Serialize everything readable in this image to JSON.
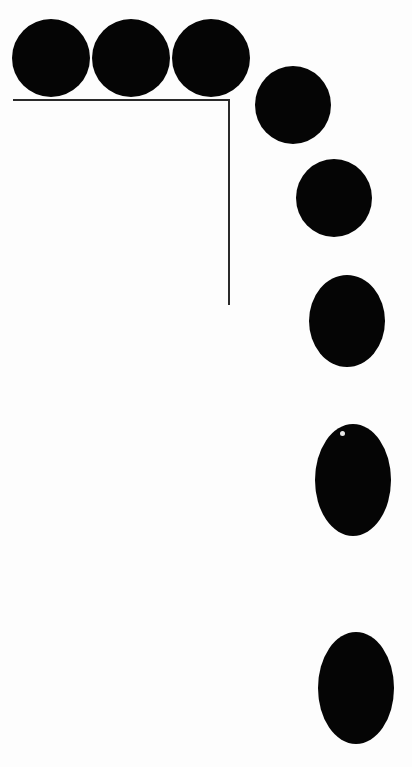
{
  "diagram": {
    "colors": {
      "ball": "#050505",
      "ledge": "#2a2a2a",
      "background": "#fdfdfd"
    },
    "ledge": {
      "top": {
        "x1": 13,
        "x2": 230,
        "y": 100
      },
      "wall": {
        "x": 229,
        "y1": 100,
        "y2": 305
      }
    },
    "balls": [
      {
        "cx": 51,
        "cy": 58,
        "rx": 39,
        "ry": 39
      },
      {
        "cx": 131,
        "cy": 58,
        "rx": 39,
        "ry": 39
      },
      {
        "cx": 211,
        "cy": 58,
        "rx": 39,
        "ry": 39
      },
      {
        "cx": 293,
        "cy": 105,
        "rx": 38,
        "ry": 39
      },
      {
        "cx": 334,
        "cy": 198,
        "rx": 38,
        "ry": 39
      },
      {
        "cx": 347,
        "cy": 321,
        "rx": 38,
        "ry": 46
      },
      {
        "cx": 353,
        "cy": 480,
        "rx": 38,
        "ry": 56
      },
      {
        "cx": 356,
        "cy": 688,
        "rx": 38,
        "ry": 56
      }
    ]
  }
}
